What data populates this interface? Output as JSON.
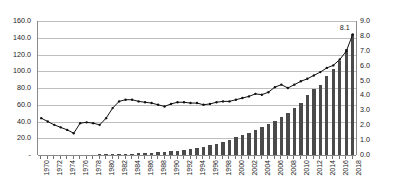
{
  "chart_data": {
    "type": "bar",
    "title": "",
    "subtitle": "",
    "xlabel": "",
    "ylabel": "",
    "y2label": "",
    "grid": true,
    "legend": "none",
    "x": [
      1970,
      1971,
      1972,
      1973,
      1974,
      1975,
      1976,
      1977,
      1978,
      1979,
      1980,
      1981,
      1982,
      1983,
      1984,
      1985,
      1986,
      1987,
      1988,
      1989,
      1990,
      1991,
      1992,
      1993,
      1994,
      1995,
      1996,
      1997,
      1998,
      1999,
      2000,
      2001,
      2002,
      2003,
      2004,
      2005,
      2006,
      2007,
      2008,
      2009,
      2010,
      2011,
      2012,
      2013,
      2014,
      2015,
      2016,
      2017,
      2018
    ],
    "x_tick_labels": [
      "1970",
      "1972",
      "1974",
      "1976",
      "1978",
      "1980",
      "1982",
      "1984",
      "1986",
      "1988",
      "1990",
      "1992",
      "1994",
      "1996",
      "1998",
      "2000",
      "2002",
      "2004",
      "2006",
      "2008",
      "2010",
      "2012",
      "2014",
      "2016",
      "2018"
    ],
    "left_axis": {
      "ticks": [
        "-",
        "20.0",
        "40.0",
        "60.0",
        "80.0",
        "100.0",
        "120.0",
        "140.0",
        "160.0"
      ],
      "tick_values": [
        0,
        20,
        40,
        60,
        80,
        100,
        120,
        140,
        160
      ],
      "min": 0,
      "max": 160
    },
    "right_axis": {
      "ticks": [
        "0.0",
        "1.0",
        "2.0",
        "3.0",
        "4.0",
        "5.0",
        "6.0",
        "7.0",
        "8.0",
        "9.0"
      ],
      "tick_values": [
        0,
        1,
        2,
        3,
        4,
        5,
        6,
        7,
        8,
        9
      ],
      "min": 0,
      "max": 9
    },
    "series": [
      {
        "name": "line-series",
        "type": "line",
        "axis": "left",
        "color": "#111111",
        "values": [
          44,
          40,
          36,
          33,
          30,
          26,
          38,
          39,
          38,
          36,
          44,
          56,
          64,
          66,
          66,
          64,
          63,
          62,
          60,
          58,
          61,
          63,
          63,
          62,
          62,
          60,
          61,
          63,
          64,
          64,
          66,
          68,
          70,
          73,
          72,
          75,
          81,
          84,
          80,
          84,
          88,
          91,
          95,
          99,
          104,
          107,
          114,
          124,
          144
        ]
      },
      {
        "name": "bar-series",
        "type": "bar",
        "axis": "right",
        "color": "#4a4a4a",
        "values": [
          0,
          0,
          0,
          0,
          0,
          0,
          0,
          0,
          0,
          0.02,
          0.03,
          0.05,
          0.06,
          0.08,
          0.09,
          0.11,
          0.13,
          0.15,
          0.17,
          0.2,
          0.24,
          0.29,
          0.34,
          0.4,
          0.47,
          0.55,
          0.65,
          0.76,
          0.88,
          1.02,
          1.18,
          1.34,
          1.5,
          1.65,
          1.85,
          2.05,
          2.3,
          2.55,
          2.85,
          3.15,
          3.5,
          4.0,
          4.45,
          4.7,
          5.3,
          5.75,
          6.3,
          7.1,
          8.1
        ]
      }
    ],
    "annotations": [
      {
        "name": "last-value-label",
        "text": "8.1",
        "x": 2018,
        "series": "bar-series"
      }
    ]
  }
}
